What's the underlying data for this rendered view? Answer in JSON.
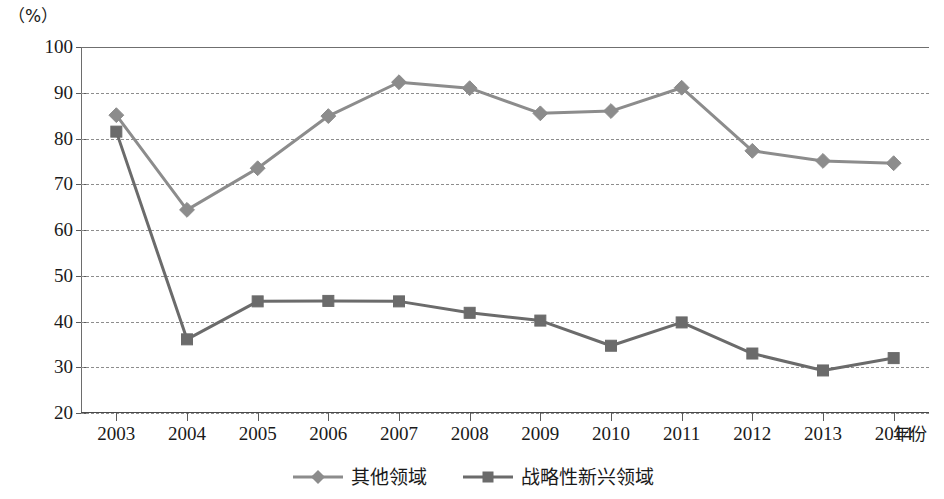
{
  "chart_data": {
    "type": "line",
    "title": "",
    "xlabel": "年份",
    "ylabel": "",
    "y_unit_label": "（%）",
    "categories": [
      "2003",
      "2004",
      "2005",
      "2006",
      "2007",
      "2008",
      "2009",
      "2010",
      "2011",
      "2012",
      "2013",
      "2014"
    ],
    "x": [
      2003,
      2004,
      2005,
      2006,
      2007,
      2008,
      2009,
      2010,
      2011,
      2012,
      2013,
      2014
    ],
    "ylim": [
      20,
      100
    ],
    "yticks": [
      20,
      30,
      40,
      50,
      60,
      70,
      80,
      90,
      100
    ],
    "grid": true,
    "grid_axis": "y",
    "legend_position": "bottom",
    "series": [
      {
        "name": "其他领域",
        "marker": "diamond",
        "color": "#8c8c8c",
        "values": [
          85.1,
          64.4,
          73.5,
          84.9,
          92.3,
          91.0,
          85.5,
          86.0,
          91.1,
          77.3,
          75.1,
          74.6
        ]
      },
      {
        "name": "战略性新兴领域",
        "marker": "square",
        "color": "#6b6b6b",
        "values": [
          81.5,
          36.1,
          44.4,
          44.5,
          44.4,
          41.9,
          40.2,
          34.7,
          39.8,
          33.0,
          29.3,
          32.0
        ]
      }
    ]
  },
  "axis": {
    "y_unit": "（%）",
    "x_title": "年份",
    "y_tick_labels": [
      "100",
      "90",
      "80",
      "70",
      "60",
      "50",
      "40",
      "30",
      "20"
    ],
    "x_tick_labels": [
      "2003",
      "2004",
      "2005",
      "2006",
      "2007",
      "2008",
      "2009",
      "2010",
      "2011",
      "2012",
      "2013",
      "2014"
    ]
  },
  "legend": {
    "items": [
      {
        "label": "其他领域",
        "marker": "diamond-marker",
        "color": "#8c8c8c"
      },
      {
        "label": "战略性新兴领域",
        "marker": "square-marker",
        "color": "#6b6b6b"
      }
    ]
  },
  "colors": {
    "series_other": "#8c8c8c",
    "series_strategic": "#6b6b6b",
    "grid": "#8d8d8d",
    "axis": "#4a4a4a",
    "text": "#1a1a1a",
    "background": "#ffffff"
  }
}
